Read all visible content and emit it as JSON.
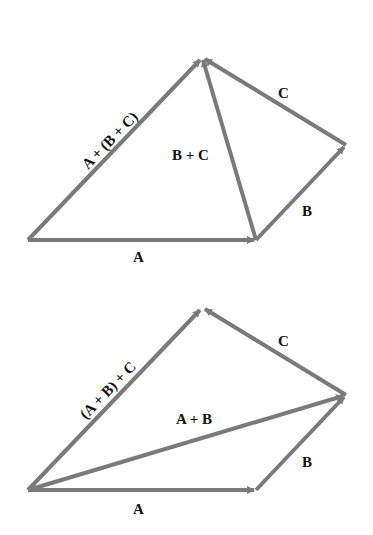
{
  "diagrams": [
    {
      "name": "associative-a-plus-bc",
      "labels": {
        "A": "A",
        "B": "B",
        "C": "C",
        "BC": "B + C",
        "result": "A + (B + C)"
      }
    },
    {
      "name": "associative-ab-plus-c",
      "labels": {
        "A": "A",
        "B": "B",
        "C": "C",
        "AB": "A + B",
        "result": "(A + B) + C"
      }
    }
  ],
  "colors": {
    "arrow": "#7a7a7a",
    "text": "#111111"
  }
}
